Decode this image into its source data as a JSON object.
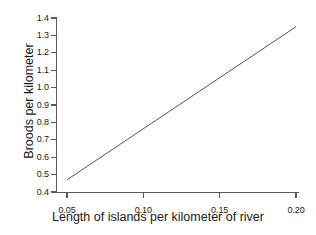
{
  "chart_data": {
    "type": "line",
    "title": "",
    "xlabel": "Length of islands per kilometer of river",
    "ylabel": "Broods per kilometer",
    "xlim": [
      0.05,
      0.2
    ],
    "ylim": [
      0.4,
      1.4
    ],
    "grid": false,
    "legend": "none",
    "x_ticks": [
      0.05,
      0.1,
      0.15,
      0.2
    ],
    "x_tick_labels": [
      "0.05",
      "0.10",
      "0.15",
      "0.20"
    ],
    "y_ticks": [
      0.4,
      0.5,
      0.6,
      0.7,
      0.8,
      0.9,
      1.0,
      1.1,
      1.2,
      1.3,
      1.4
    ],
    "y_tick_labels": [
      "0.4",
      "0.5",
      "0.6",
      "0.7",
      "0.8",
      "0.9",
      "1.0",
      "1.1",
      "1.2",
      "1.3",
      "1.4"
    ],
    "series": [
      {
        "name": "regression line",
        "x": [
          0.05,
          0.2
        ],
        "values": [
          0.47,
          1.35
        ],
        "color": "#555555",
        "style": "solid",
        "markers": "none"
      }
    ]
  },
  "figure": {
    "background_color": "#ffffff",
    "axis_color": "#595959",
    "text_color": "#1a1a1a"
  }
}
